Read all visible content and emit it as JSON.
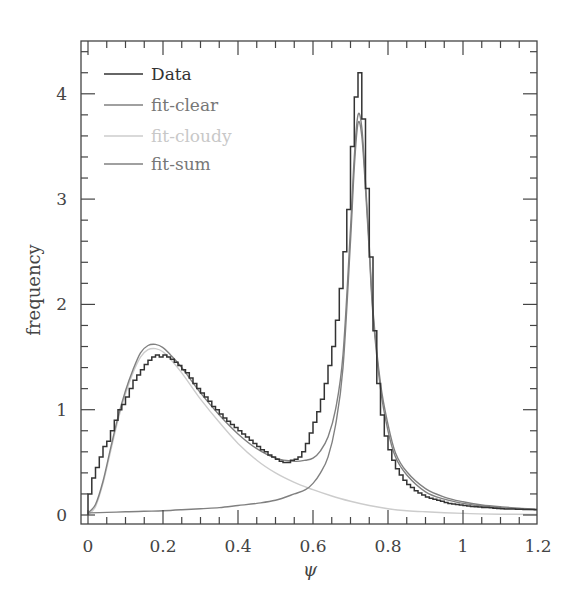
{
  "chart_data": {
    "type": "line",
    "title": "",
    "xlabel": "ψ",
    "ylabel": "frequency",
    "xlim": [
      -0.02,
      1.2
    ],
    "ylim": [
      -0.05,
      4.5
    ],
    "grid": false,
    "legend_placement": "top-left",
    "x_ticks": [
      0,
      0.2,
      0.4,
      0.6,
      0.8,
      1,
      1.2
    ],
    "x_tick_labels": [
      "0",
      "0.2",
      "0.4",
      "0.6",
      "0.8",
      "1",
      "1.2"
    ],
    "y_ticks": [
      0,
      1,
      2,
      3,
      4
    ],
    "y_tick_labels": [
      "0",
      "1",
      "2",
      "3",
      "4"
    ],
    "legend": [
      {
        "name": "Data",
        "color": "#333333"
      },
      {
        "name": "fit-clear",
        "color": "#808080"
      },
      {
        "name": "fit-cloudy",
        "color": "#cccccc"
      },
      {
        "name": "fit-sum",
        "color": "#808080"
      }
    ],
    "histogram": {
      "name": "Data",
      "bin_start": 0,
      "bin_width": 0.01,
      "values": [
        0.2,
        0.35,
        0.45,
        0.55,
        0.65,
        0.7,
        0.8,
        0.9,
        1.0,
        1.05,
        1.12,
        1.2,
        1.28,
        1.33,
        1.38,
        1.43,
        1.47,
        1.5,
        1.52,
        1.5,
        1.52,
        1.5,
        1.48,
        1.45,
        1.42,
        1.38,
        1.35,
        1.3,
        1.25,
        1.2,
        1.16,
        1.12,
        1.08,
        1.03,
        1.0,
        0.96,
        0.92,
        0.89,
        0.86,
        0.83,
        0.8,
        0.77,
        0.74,
        0.71,
        0.68,
        0.65,
        0.62,
        0.6,
        0.57,
        0.55,
        0.53,
        0.51,
        0.5,
        0.5,
        0.52,
        0.53,
        0.55,
        0.6,
        0.68,
        0.78,
        0.88,
        0.98,
        1.1,
        1.25,
        1.42,
        1.6,
        1.85,
        2.15,
        2.5,
        2.9,
        3.5,
        3.97,
        4.2,
        3.76,
        3.1,
        2.45,
        1.75,
        1.25,
        0.95,
        0.75,
        0.62,
        0.52,
        0.44,
        0.38,
        0.33,
        0.29,
        0.26,
        0.23,
        0.21,
        0.19,
        0.17,
        0.16,
        0.15,
        0.14,
        0.13,
        0.12,
        0.11,
        0.105,
        0.1,
        0.095,
        0.09,
        0.085,
        0.08,
        0.078,
        0.075,
        0.072,
        0.07,
        0.068,
        0.065,
        0.063,
        0.06,
        0.058,
        0.057,
        0.056,
        0.055,
        0.054,
        0.053,
        0.052,
        0.051,
        0.05
      ]
    },
    "series": [
      {
        "name": "fit-clear",
        "x": [
          0,
          0.05,
          0.1,
          0.15,
          0.2,
          0.25,
          0.3,
          0.35,
          0.4,
          0.45,
          0.5,
          0.55,
          0.58,
          0.6,
          0.62,
          0.64,
          0.66,
          0.68,
          0.7,
          0.71,
          0.72,
          0.73,
          0.74,
          0.75,
          0.76,
          0.78,
          0.8,
          0.82,
          0.85,
          0.9,
          0.95,
          1.0,
          1.05,
          1.1,
          1.15,
          1.2
        ],
        "y": [
          0.02,
          0.025,
          0.03,
          0.035,
          0.04,
          0.05,
          0.06,
          0.07,
          0.09,
          0.11,
          0.14,
          0.2,
          0.24,
          0.3,
          0.4,
          0.55,
          0.85,
          1.4,
          2.6,
          3.3,
          3.72,
          3.6,
          3.1,
          2.5,
          1.9,
          1.2,
          0.8,
          0.55,
          0.38,
          0.22,
          0.15,
          0.11,
          0.085,
          0.07,
          0.058,
          0.05
        ]
      },
      {
        "name": "fit-cloudy",
        "x": [
          0,
          0.02,
          0.04,
          0.06,
          0.08,
          0.1,
          0.12,
          0.14,
          0.16,
          0.18,
          0.2,
          0.22,
          0.25,
          0.3,
          0.35,
          0.4,
          0.45,
          0.5,
          0.55,
          0.6,
          0.65,
          0.7,
          0.75,
          0.8,
          0.85,
          0.9,
          1.0,
          1.1,
          1.2
        ],
        "y": [
          0,
          0.08,
          0.3,
          0.6,
          0.9,
          1.15,
          1.35,
          1.5,
          1.57,
          1.58,
          1.55,
          1.48,
          1.35,
          1.1,
          0.88,
          0.68,
          0.52,
          0.4,
          0.31,
          0.24,
          0.18,
          0.13,
          0.09,
          0.06,
          0.04,
          0.03,
          0.015,
          0.008,
          0.005
        ]
      },
      {
        "name": "fit-sum",
        "x": [
          0,
          0.02,
          0.04,
          0.06,
          0.08,
          0.1,
          0.12,
          0.14,
          0.16,
          0.18,
          0.2,
          0.22,
          0.25,
          0.3,
          0.35,
          0.4,
          0.45,
          0.5,
          0.55,
          0.58,
          0.6,
          0.62,
          0.64,
          0.66,
          0.68,
          0.7,
          0.71,
          0.72,
          0.73,
          0.74,
          0.75,
          0.76,
          0.78,
          0.8,
          0.82,
          0.85,
          0.9,
          0.95,
          1.0,
          1.05,
          1.1,
          1.15,
          1.2
        ],
        "y": [
          0.02,
          0.1,
          0.32,
          0.63,
          0.93,
          1.18,
          1.38,
          1.54,
          1.61,
          1.62,
          1.59,
          1.52,
          1.4,
          1.16,
          0.95,
          0.77,
          0.63,
          0.54,
          0.51,
          0.52,
          0.54,
          0.61,
          0.74,
          1.0,
          1.52,
          2.72,
          3.4,
          3.8,
          3.68,
          3.16,
          2.55,
          1.94,
          1.25,
          0.86,
          0.59,
          0.41,
          0.25,
          0.17,
          0.125,
          0.095,
          0.078,
          0.065,
          0.055
        ]
      }
    ]
  }
}
